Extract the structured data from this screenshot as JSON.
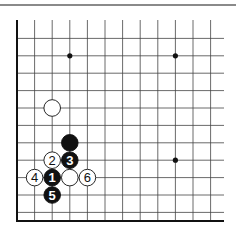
{
  "diagram": {
    "type": "go-board-diagram",
    "grid": {
      "cols": [
        17,
        34.6,
        52.2,
        69.8,
        87.4,
        105,
        122.6,
        140.2,
        157.8,
        175.4,
        193,
        210.6
      ],
      "rows": [
        21,
        38.4,
        55.8,
        73.2,
        90.6,
        108,
        125.4,
        142.8,
        160.2,
        177.6,
        195,
        212.4
      ],
      "right_edge": 224,
      "top_edge": 20,
      "bottom_edge": 221,
      "left_edge": 17
    },
    "star_points": [
      [
        3,
        2
      ],
      [
        9,
        2
      ],
      [
        9,
        8
      ]
    ],
    "stones": [
      {
        "color": "white",
        "col": 2,
        "row": 5,
        "label": ""
      },
      {
        "color": "black",
        "col": 3,
        "row": 7,
        "label": ""
      },
      {
        "color": "white",
        "col": 2,
        "row": 8,
        "label": "2"
      },
      {
        "color": "black",
        "col": 3,
        "row": 8,
        "label": "3"
      },
      {
        "color": "white",
        "col": 1,
        "row": 9,
        "label": "4"
      },
      {
        "color": "black",
        "col": 2,
        "row": 9,
        "label": "1"
      },
      {
        "color": "white",
        "col": 3,
        "row": 9,
        "label": ""
      },
      {
        "color": "white",
        "col": 4,
        "row": 9,
        "label": "6"
      },
      {
        "color": "black",
        "col": 2,
        "row": 10,
        "label": "5"
      }
    ]
  }
}
